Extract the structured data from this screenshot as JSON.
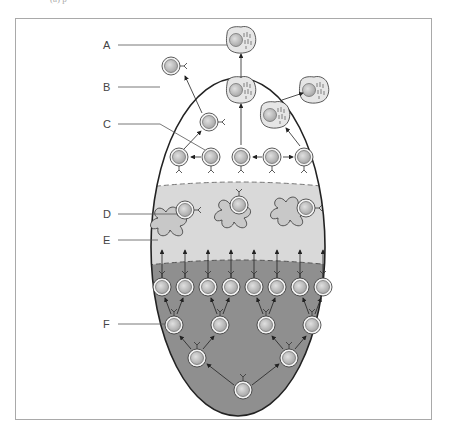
{
  "caption_fragment": "(a) p",
  "figure": {
    "type": "lymphocyte clonal selection / germinal center diagram",
    "labels": [
      {
        "id": "A",
        "text": "A",
        "points_to": "plasma cell leaving top"
      },
      {
        "id": "B",
        "text": "B",
        "points_to": "memory B cell leaving"
      },
      {
        "id": "C",
        "text": "C",
        "points_to": "B cell in light zone"
      },
      {
        "id": "D",
        "text": "D",
        "points_to": "B cell bound to follicular dendritic cell"
      },
      {
        "id": "E",
        "text": "E",
        "points_to": "follicular dendritic cell"
      },
      {
        "id": "F",
        "text": "F",
        "points_to": "proliferating centroblast in dark zone"
      }
    ],
    "zones": [
      {
        "name": "top zone",
        "color": "#ffffff"
      },
      {
        "name": "light zone",
        "color": "#d9d9d9"
      },
      {
        "name": "dark zone",
        "color": "#8f8f8f"
      }
    ],
    "colors": {
      "outline": "#222222",
      "cell_fill": "#c4c4c4",
      "cell_ring": "#f2f2f2",
      "plasma_fill": "#e6e6e6",
      "label_line": "#555555",
      "frame": "#a9a9a9"
    }
  }
}
